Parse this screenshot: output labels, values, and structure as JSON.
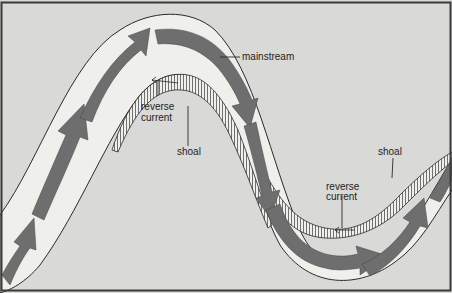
{
  "diagram": {
    "labels": {
      "mainstream": "mainstream",
      "reverse_current_top_line1": "reverse",
      "reverse_current_top_line2": "current",
      "shoal_top": "shoal",
      "reverse_current_bottom_line1": "reverse",
      "reverse_current_bottom_line2": "current",
      "shoal_bottom": "shoal"
    },
    "colors": {
      "background": "#d9d9d7",
      "river": "#efefec",
      "arrow": "#6e6e6e",
      "line": "#2a2a2a",
      "frame": "#3a3a3a"
    }
  }
}
